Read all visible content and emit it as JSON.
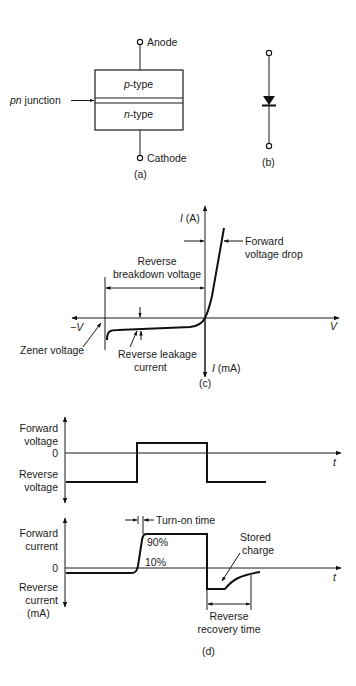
{
  "panel_a": {
    "anode": "Anode",
    "cathode": "Cathode",
    "p_type_italic": "p",
    "p_type_rest": "-type",
    "n_type_italic": "n",
    "n_type_rest": "-type",
    "junction_italic": "pn",
    "junction_rest": " junction",
    "caption": "(a)"
  },
  "panel_b": {
    "caption": "(b)",
    "symbol": "diode-symbol"
  },
  "panel_c": {
    "y_pos_label_italic": "I",
    "y_pos_label_rest": " (A)",
    "y_neg_label_italic": "I",
    "y_neg_label_rest": " (mA)",
    "x_pos_label": "V",
    "x_neg_label": "−V",
    "forward_drop_line1": "Forward",
    "forward_drop_line2": "voltage drop",
    "breakdown_line1": "Reverse",
    "breakdown_line2": "breakdown voltage",
    "zener": "Zener voltage",
    "leakage_line1": "Reverse leakage",
    "leakage_line2": "current",
    "caption": "(c)"
  },
  "panel_d": {
    "voltage_plot": {
      "forward_line1": "Forward",
      "forward_line2": "voltage",
      "zero": "0",
      "reverse_line1": "Reverse",
      "reverse_line2": "voltage",
      "t_label": "t"
    },
    "current_plot": {
      "forward_line1": "Forward",
      "forward_line2": "current",
      "zero": "0",
      "reverse_line1": "Reverse",
      "reverse_line2": "current",
      "reverse_line3": "(mA)",
      "t_label": "t",
      "turn_on": "Turn-on time",
      "pct_90": "90%",
      "pct_10": "10%",
      "stored_line1": "Stored",
      "stored_line2": "charge",
      "recovery_line1": "Reverse",
      "recovery_line2": "recovery time"
    },
    "caption": "(d)"
  }
}
